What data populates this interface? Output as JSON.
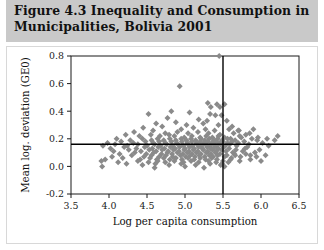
{
  "figure": {
    "title": "Figure 4.3  Inequality and Consumption in\nMunicipalities, Bolivia 2001",
    "title_line_1": "Figure 4.3  Inequality and Consumption in",
    "title_line_2": "Municipalities, Bolivia 2001",
    "band_color": "#c9c9c9",
    "panel_background": "#ffffff"
  },
  "chart_data": {
    "type": "scatter",
    "title": "Figure 4.3  Inequality and Consumption in Municipalities, Bolivia 2001",
    "subtitle": "",
    "xlabel": "Log per capita consumption",
    "ylabel": "Mean log. deviation (GE0)",
    "xlim": [
      3.5,
      6.5
    ],
    "ylim": [
      -0.2,
      0.8
    ],
    "xticks": [
      3.5,
      4.0,
      4.5,
      5.0,
      5.5,
      6.0,
      6.5
    ],
    "xtick_labels": [
      "3.5",
      "4.0",
      "4.5",
      "5.0",
      "5.5",
      "6.0",
      "6.5"
    ],
    "yticks": [
      -0.2,
      0.0,
      0.2,
      0.4,
      0.6,
      0.8
    ],
    "ytick_labels": [
      "-0.2",
      "0.0",
      "0.2",
      "0.4",
      "0.6",
      "0.8"
    ],
    "grid": false,
    "legend": "none",
    "marker": {
      "shape": "diamond",
      "color": "#8a8a8a",
      "size": 3.0
    },
    "reference_lines": [
      {
        "name": "mean-inequality-line",
        "orientation": "horizontal",
        "value": 0.16,
        "color": "#000000"
      },
      {
        "name": "mean-consumption-line",
        "orientation": "vertical",
        "value": 5.5,
        "color": "#000000"
      }
    ],
    "series": [
      {
        "name": "Municipalities",
        "points": [
          [
            5.45,
            0.8
          ],
          [
            4.93,
            0.58
          ],
          [
            5.3,
            0.46
          ],
          [
            5.42,
            0.45
          ],
          [
            5.52,
            0.45
          ],
          [
            5.34,
            0.43
          ],
          [
            5.46,
            0.43
          ],
          [
            4.52,
            0.38
          ],
          [
            4.82,
            0.4
          ],
          [
            5.06,
            0.39
          ],
          [
            5.33,
            0.38
          ],
          [
            5.4,
            0.37
          ],
          [
            5.48,
            0.37
          ],
          [
            4.77,
            0.35
          ],
          [
            5.18,
            0.34
          ],
          [
            5.29,
            0.33
          ],
          [
            5.55,
            0.33
          ],
          [
            4.62,
            0.31
          ],
          [
            4.88,
            0.32
          ],
          [
            5.02,
            0.3
          ],
          [
            5.24,
            0.31
          ],
          [
            5.44,
            0.3
          ],
          [
            5.62,
            0.29
          ],
          [
            4.45,
            0.28
          ],
          [
            4.7,
            0.29
          ],
          [
            4.95,
            0.27
          ],
          [
            5.11,
            0.28
          ],
          [
            5.27,
            0.27
          ],
          [
            5.39,
            0.26
          ],
          [
            5.58,
            0.27
          ],
          [
            5.71,
            0.26
          ],
          [
            4.33,
            0.25
          ],
          [
            4.58,
            0.26
          ],
          [
            4.74,
            0.24
          ],
          [
            4.9,
            0.25
          ],
          [
            5.04,
            0.24
          ],
          [
            5.17,
            0.25
          ],
          [
            5.31,
            0.24
          ],
          [
            5.46,
            0.23
          ],
          [
            5.64,
            0.24
          ],
          [
            5.8,
            0.23
          ],
          [
            4.22,
            0.23
          ],
          [
            4.4,
            0.22
          ],
          [
            4.55,
            0.23
          ],
          [
            4.67,
            0.22
          ],
          [
            4.79,
            0.23
          ],
          [
            4.86,
            0.22
          ],
          [
            4.99,
            0.21
          ],
          [
            5.09,
            0.22
          ],
          [
            5.2,
            0.21
          ],
          [
            5.28,
            0.22
          ],
          [
            5.36,
            0.21
          ],
          [
            5.44,
            0.22
          ],
          [
            5.52,
            0.21
          ],
          [
            5.6,
            0.2
          ],
          [
            5.74,
            0.21
          ],
          [
            5.88,
            0.2
          ],
          [
            4.1,
            0.2
          ],
          [
            4.28,
            0.19
          ],
          [
            4.44,
            0.2
          ],
          [
            4.56,
            0.19
          ],
          [
            4.64,
            0.2
          ],
          [
            4.72,
            0.19
          ],
          [
            4.8,
            0.2
          ],
          [
            4.88,
            0.19
          ],
          [
            4.95,
            0.2
          ],
          [
            5.02,
            0.19
          ],
          [
            5.08,
            0.2
          ],
          [
            5.14,
            0.19
          ],
          [
            5.21,
            0.2
          ],
          [
            5.26,
            0.19
          ],
          [
            5.32,
            0.2
          ],
          [
            5.38,
            0.19
          ],
          [
            5.43,
            0.2
          ],
          [
            5.49,
            0.19
          ],
          [
            5.56,
            0.2
          ],
          [
            5.66,
            0.19
          ],
          [
            5.78,
            0.18
          ],
          [
            5.95,
            0.19
          ],
          [
            3.98,
            0.17
          ],
          [
            4.16,
            0.18
          ],
          [
            4.32,
            0.17
          ],
          [
            4.48,
            0.18
          ],
          [
            4.58,
            0.17
          ],
          [
            4.66,
            0.18
          ],
          [
            4.74,
            0.17
          ],
          [
            4.82,
            0.18
          ],
          [
            4.89,
            0.17
          ],
          [
            4.96,
            0.18
          ],
          [
            5.03,
            0.17
          ],
          [
            5.09,
            0.18
          ],
          [
            5.15,
            0.17
          ],
          [
            5.2,
            0.18
          ],
          [
            5.25,
            0.17
          ],
          [
            5.3,
            0.18
          ],
          [
            5.35,
            0.17
          ],
          [
            5.4,
            0.18
          ],
          [
            5.45,
            0.17
          ],
          [
            5.5,
            0.18
          ],
          [
            5.56,
            0.17
          ],
          [
            5.62,
            0.18
          ],
          [
            5.7,
            0.17
          ],
          [
            5.84,
            0.16
          ],
          [
            6.02,
            0.17
          ],
          [
            3.92,
            0.15
          ],
          [
            4.08,
            0.16
          ],
          [
            4.24,
            0.15
          ],
          [
            4.38,
            0.16
          ],
          [
            4.5,
            0.15
          ],
          [
            4.6,
            0.16
          ],
          [
            4.68,
            0.15
          ],
          [
            4.76,
            0.16
          ],
          [
            4.84,
            0.15
          ],
          [
            4.91,
            0.16
          ],
          [
            4.98,
            0.15
          ],
          [
            5.04,
            0.16
          ],
          [
            5.1,
            0.15
          ],
          [
            5.16,
            0.16
          ],
          [
            5.22,
            0.15
          ],
          [
            5.27,
            0.16
          ],
          [
            5.33,
            0.15
          ],
          [
            5.38,
            0.16
          ],
          [
            5.42,
            0.15
          ],
          [
            5.47,
            0.16
          ],
          [
            5.53,
            0.15
          ],
          [
            5.59,
            0.16
          ],
          [
            5.68,
            0.15
          ],
          [
            5.82,
            0.14
          ],
          [
            6.1,
            0.15
          ],
          [
            4.02,
            0.13
          ],
          [
            4.2,
            0.14
          ],
          [
            4.36,
            0.13
          ],
          [
            4.47,
            0.14
          ],
          [
            4.57,
            0.13
          ],
          [
            4.65,
            0.14
          ],
          [
            4.73,
            0.13
          ],
          [
            4.81,
            0.14
          ],
          [
            4.87,
            0.13
          ],
          [
            4.93,
            0.14
          ],
          [
            5.0,
            0.13
          ],
          [
            5.06,
            0.14
          ],
          [
            5.12,
            0.13
          ],
          [
            5.18,
            0.14
          ],
          [
            5.23,
            0.13
          ],
          [
            5.29,
            0.14
          ],
          [
            5.34,
            0.13
          ],
          [
            5.39,
            0.14
          ],
          [
            5.44,
            0.13
          ],
          [
            5.51,
            0.14
          ],
          [
            5.58,
            0.13
          ],
          [
            5.67,
            0.12
          ],
          [
            5.79,
            0.13
          ],
          [
            5.98,
            0.12
          ],
          [
            4.06,
            0.11
          ],
          [
            4.26,
            0.12
          ],
          [
            4.42,
            0.11
          ],
          [
            4.53,
            0.12
          ],
          [
            4.62,
            0.11
          ],
          [
            4.7,
            0.12
          ],
          [
            4.78,
            0.11
          ],
          [
            4.85,
            0.12
          ],
          [
            4.92,
            0.11
          ],
          [
            4.99,
            0.12
          ],
          [
            5.05,
            0.11
          ],
          [
            5.11,
            0.12
          ],
          [
            5.17,
            0.11
          ],
          [
            5.24,
            0.12
          ],
          [
            5.3,
            0.11
          ],
          [
            5.36,
            0.12
          ],
          [
            5.41,
            0.11
          ],
          [
            5.48,
            0.12
          ],
          [
            5.54,
            0.11
          ],
          [
            5.63,
            0.1
          ],
          [
            5.76,
            0.11
          ],
          [
            5.92,
            0.1
          ],
          [
            4.14,
            0.09
          ],
          [
            4.34,
            0.1
          ],
          [
            4.49,
            0.09
          ],
          [
            4.59,
            0.1
          ],
          [
            4.69,
            0.09
          ],
          [
            4.77,
            0.1
          ],
          [
            4.83,
            0.09
          ],
          [
            4.9,
            0.1
          ],
          [
            4.97,
            0.09
          ],
          [
            5.03,
            0.1
          ],
          [
            5.09,
            0.09
          ],
          [
            5.15,
            0.1
          ],
          [
            5.21,
            0.09
          ],
          [
            5.28,
            0.1
          ],
          [
            5.34,
            0.09
          ],
          [
            5.4,
            0.1
          ],
          [
            5.46,
            0.09
          ],
          [
            5.55,
            0.08
          ],
          [
            5.65,
            0.09
          ],
          [
            5.86,
            0.08
          ],
          [
            4.04,
            0.07
          ],
          [
            4.3,
            0.08
          ],
          [
            4.46,
            0.07
          ],
          [
            4.56,
            0.08
          ],
          [
            4.66,
            0.07
          ],
          [
            4.75,
            0.08
          ],
          [
            4.84,
            0.07
          ],
          [
            4.94,
            0.08
          ],
          [
            5.01,
            0.07
          ],
          [
            5.07,
            0.08
          ],
          [
            5.13,
            0.07
          ],
          [
            5.19,
            0.08
          ],
          [
            5.26,
            0.07
          ],
          [
            5.32,
            0.08
          ],
          [
            5.37,
            0.07
          ],
          [
            5.43,
            0.08
          ],
          [
            5.52,
            0.07
          ],
          [
            5.61,
            0.06
          ],
          [
            5.73,
            0.07
          ],
          [
            3.95,
            0.05
          ],
          [
            4.18,
            0.06
          ],
          [
            4.41,
            0.05
          ],
          [
            4.54,
            0.06
          ],
          [
            4.63,
            0.05
          ],
          [
            4.72,
            0.06
          ],
          [
            4.8,
            0.05
          ],
          [
            4.88,
            0.06
          ],
          [
            4.96,
            0.05
          ],
          [
            5.04,
            0.06
          ],
          [
            5.12,
            0.05
          ],
          [
            5.2,
            0.06
          ],
          [
            5.27,
            0.05
          ],
          [
            5.35,
            0.06
          ],
          [
            5.42,
            0.05
          ],
          [
            5.5,
            0.04
          ],
          [
            5.6,
            0.05
          ],
          [
            5.72,
            0.04
          ],
          [
            4.12,
            0.03
          ],
          [
            4.38,
            0.04
          ],
          [
            4.52,
            0.03
          ],
          [
            4.64,
            0.04
          ],
          [
            4.74,
            0.03
          ],
          [
            4.86,
            0.04
          ],
          [
            4.98,
            0.03
          ],
          [
            5.08,
            0.04
          ],
          [
            5.18,
            0.03
          ],
          [
            5.31,
            0.04
          ],
          [
            5.41,
            0.03
          ],
          [
            5.49,
            0.02
          ],
          [
            5.57,
            0.03
          ],
          [
            3.9,
            0.04
          ],
          [
            3.91,
            0.0
          ],
          [
            4.23,
            0.02
          ],
          [
            4.44,
            0.01
          ],
          [
            4.61,
            0.02
          ],
          [
            4.79,
            0.01
          ],
          [
            4.95,
            0.02
          ],
          [
            5.14,
            0.01
          ],
          [
            5.33,
            0.02
          ],
          [
            5.47,
            0.01
          ],
          [
            4.6,
            -0.01
          ],
          [
            5.0,
            0.0
          ],
          [
            5.25,
            -0.01
          ],
          [
            5.52,
            0.0
          ],
          [
            5.72,
            0.22
          ],
          [
            5.85,
            0.24
          ],
          [
            5.96,
            0.21
          ],
          [
            6.08,
            0.2
          ],
          [
            6.18,
            0.19
          ],
          [
            5.7,
            0.26
          ],
          [
            5.9,
            0.27
          ],
          [
            6.22,
            0.22
          ],
          [
            5.66,
            0.08
          ],
          [
            5.8,
            0.09
          ],
          [
            5.94,
            0.07
          ],
          [
            6.06,
            0.08
          ],
          [
            5.86,
            0.05
          ],
          [
            6.0,
            0.04
          ]
        ]
      }
    ]
  }
}
